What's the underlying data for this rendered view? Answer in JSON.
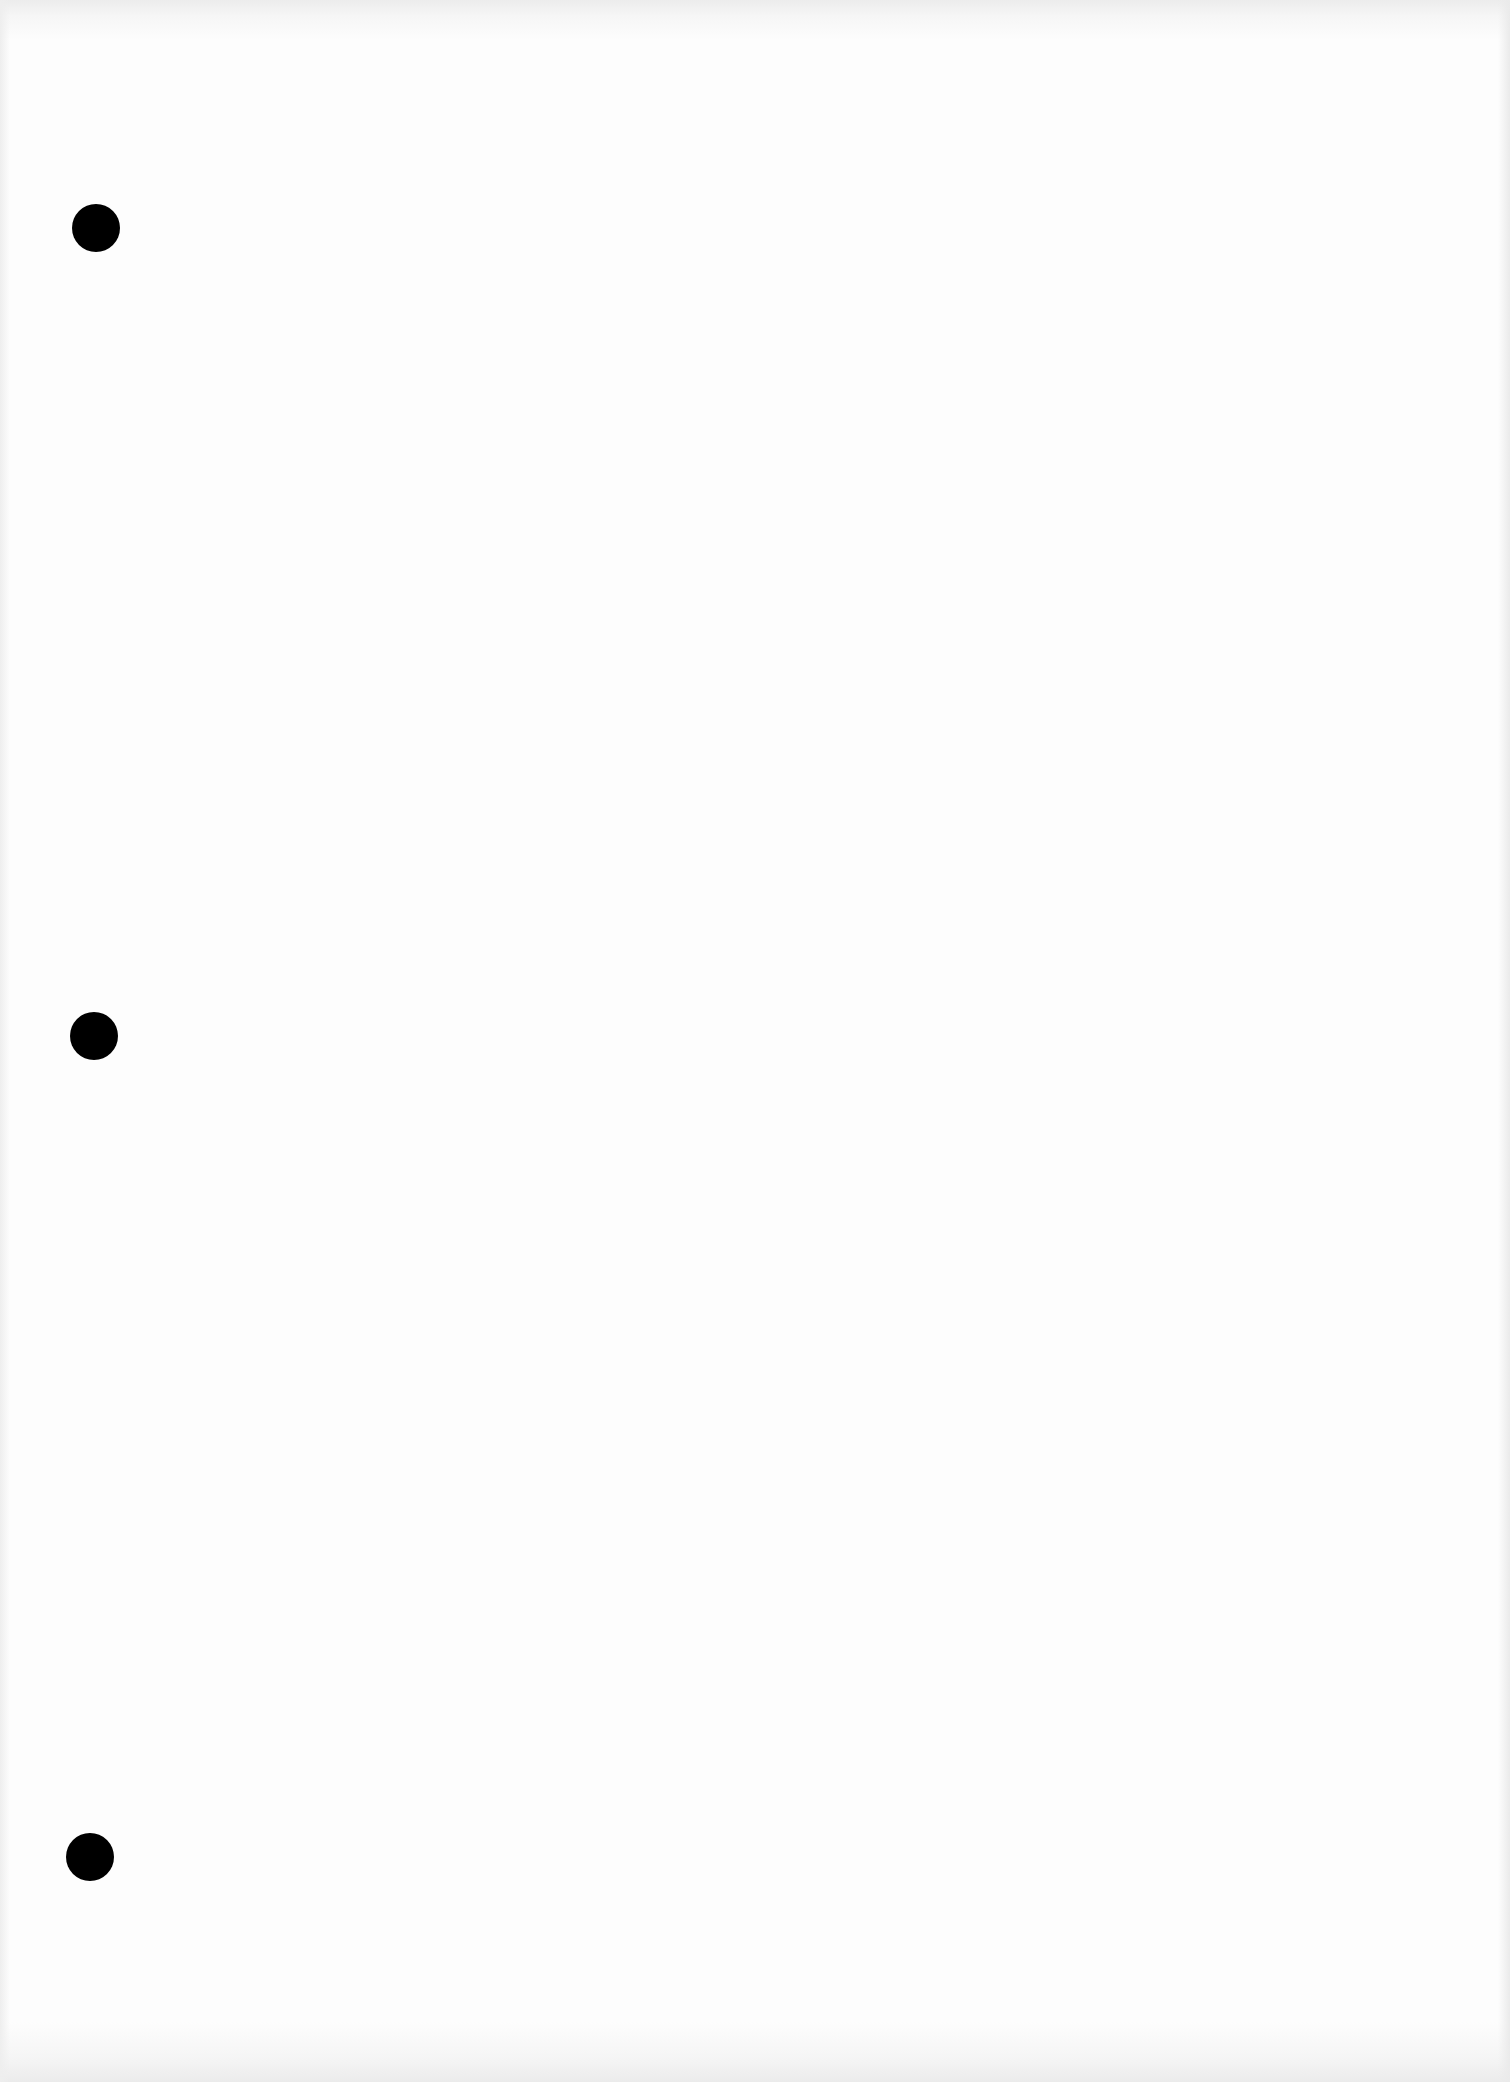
{
  "document": {
    "type": "blank scanned page",
    "background_color": "#fdfdfd",
    "text": ""
  },
  "punch_holes": [
    {
      "cx": 96,
      "cy": 228,
      "diameter": 48,
      "color": "#000000"
    },
    {
      "cx": 94,
      "cy": 1036,
      "diameter": 48,
      "color": "#000000"
    },
    {
      "cx": 90,
      "cy": 1857,
      "diameter": 48,
      "color": "#000000"
    }
  ]
}
